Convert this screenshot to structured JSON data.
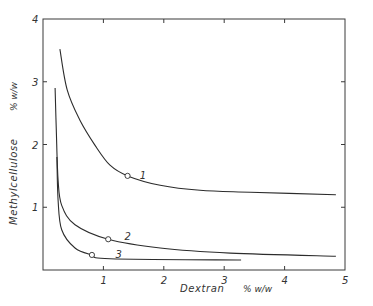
{
  "chart_data": {
    "type": "line",
    "title": "",
    "xlabel": "Dextran",
    "xlabel_unit": "% w/w",
    "ylabel": "Methylcellulose",
    "ylabel_unit": "% w/w",
    "xlim": [
      0,
      5
    ],
    "ylim": [
      0,
      4
    ],
    "xticks": [
      "1",
      "2",
      "3",
      "4",
      "5"
    ],
    "yticks": [
      "1",
      "2",
      "3",
      "4"
    ],
    "grid": false,
    "legend": "curve labels placed inline",
    "series": [
      {
        "name": "1",
        "x": [
          0.28,
          0.4,
          0.61,
          0.86,
          1.11,
          1.4,
          1.94,
          2.6,
          3.43,
          4.85
        ],
        "y": [
          3.52,
          2.87,
          2.39,
          1.99,
          1.67,
          1.5,
          1.35,
          1.27,
          1.24,
          1.2
        ],
        "marker": {
          "x": 1.4,
          "y": 1.5
        },
        "label_pos": {
          "x": 1.6,
          "y": 1.5
        }
      },
      {
        "name": "2",
        "x": [
          0.2,
          0.22,
          0.25,
          0.31,
          0.53,
          1.08,
          1.94,
          3.1,
          4.85
        ],
        "y": [
          2.9,
          2.23,
          1.43,
          1.03,
          0.72,
          0.49,
          0.35,
          0.27,
          0.22
        ],
        "marker": {
          "x": 1.08,
          "y": 0.49
        },
        "label_pos": {
          "x": 1.35,
          "y": 0.52
        }
      },
      {
        "name": "3",
        "x": [
          0.23,
          0.25,
          0.31,
          0.53,
          0.81,
          1.11,
          3.28
        ],
        "y": [
          1.8,
          1.11,
          0.64,
          0.35,
          0.24,
          0.18,
          0.16
        ],
        "marker": {
          "x": 0.81,
          "y": 0.24
        },
        "label_pos": {
          "x": 1.2,
          "y": 0.24
        }
      }
    ]
  }
}
